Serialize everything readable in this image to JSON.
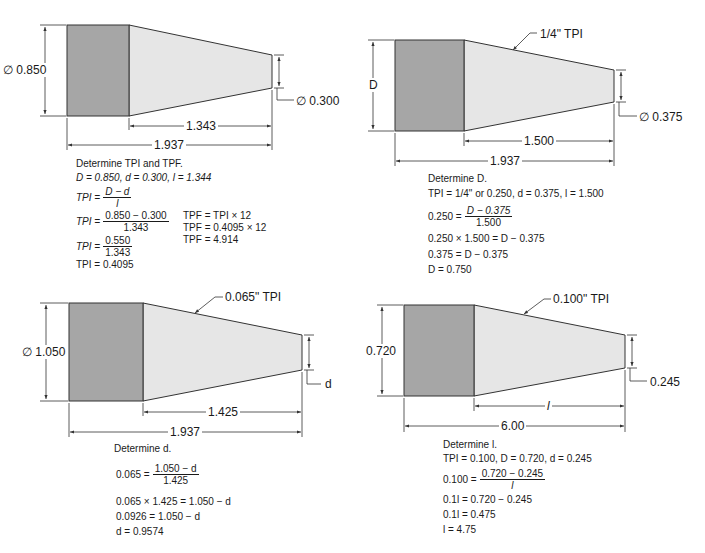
{
  "colors": {
    "block_fill": "#a6a6a6",
    "taper_fill": "#e6e6e6",
    "line": "#333333",
    "text": "#1a1a1a"
  },
  "panels": [
    {
      "id": "top-left",
      "large_diameter_label": "∅ 0.850",
      "small_diameter_label": "∅ 0.300",
      "taper_length_label": "1.343",
      "overall_length_label": "1.937",
      "title": "Determine TPI and TPF.",
      "givens": "D = 0.850, d = 0.300, l = 1.344",
      "steps": [
        {
          "lhs": "TPI =",
          "num": "D − d",
          "den": "l"
        },
        {
          "lhs": "TPI =",
          "num": "0.850 − 0.300",
          "den": "1.343"
        },
        {
          "lhs": "TPI =",
          "num": "0.550",
          "den": "1.343"
        },
        {
          "text": "TPI = 0.4095"
        }
      ],
      "side_steps": [
        "TPF = TPI × 12",
        "TPF = 0.4095 × 12",
        "TPF = 4.914"
      ]
    },
    {
      "id": "top-right",
      "callout_label": "1/4\" TPI",
      "large_diameter_label": "D",
      "small_diameter_label": "∅ 0.375",
      "taper_length_label": "1.500",
      "overall_length_label": "1.937",
      "title": "Determine D.",
      "givens": "TPI = 1/4\" or 0.250, d = 0.375, l = 1.500",
      "steps": [
        {
          "lhs": "0.250 =",
          "num": "D − 0.375",
          "den": "1.500"
        },
        {
          "text": "0.250 × 1.500 = D − 0.375"
        },
        {
          "text": "0.375 = D − 0.375"
        },
        {
          "text": "D = 0.750"
        }
      ]
    },
    {
      "id": "bottom-left",
      "callout_label": "0.065\" TPI",
      "large_diameter_label": "∅ 1.050",
      "small_diameter_label": "d",
      "taper_length_label": "1.425",
      "overall_length_label": "1.937",
      "title": "Determine d.",
      "steps": [
        {
          "lhs": "0.065 =",
          "num": "1.050 − d",
          "den": "1.425"
        },
        {
          "text": "0.065 × 1.425 = 1.050 − d"
        },
        {
          "text": "0.0926 = 1.050 − d"
        },
        {
          "text": "d = 0.9574"
        }
      ]
    },
    {
      "id": "bottom-right",
      "callout_label": "0.100\" TPI",
      "large_diameter_label": "0.720",
      "small_diameter_label": "0.245",
      "taper_length_label": "l",
      "overall_length_label": "6.00",
      "title": "Determine l.",
      "givens": "TPI = 0.100, D = 0.720, d = 0.245",
      "steps": [
        {
          "lhs": "0.100 =",
          "num": "0.720 − 0.245",
          "den": "l"
        },
        {
          "text": "0.1l = 0.720 − 0.245"
        },
        {
          "text": "0.1l = 0.475"
        },
        {
          "text": "l = 4.75"
        }
      ]
    }
  ]
}
